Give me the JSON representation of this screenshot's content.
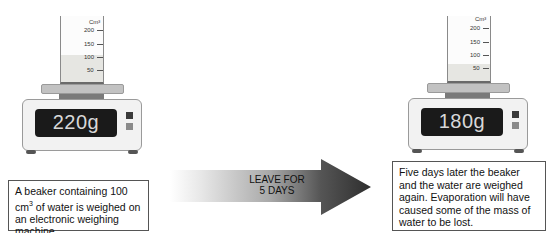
{
  "left_panel": {
    "beaker": {
      "unit_label": "Cm³",
      "ticks": [
        "200",
        "150",
        "100",
        "50"
      ],
      "water_level": "100"
    },
    "scale": {
      "reading": "220g"
    },
    "caption": {
      "line1_prefix": "A beaker containing 100 cm",
      "line1_sup": "3",
      "rest": "of water is weighed on an electronic weighing machine."
    }
  },
  "arrow": {
    "line1": "LEAVE FOR",
    "line2": "5 DAYS"
  },
  "right_panel": {
    "beaker": {
      "unit_label": "Cm³",
      "ticks": [
        "200",
        "150",
        "100",
        "50"
      ],
      "water_level": "50"
    },
    "scale": {
      "reading": "180g"
    },
    "caption": {
      "text": "Five days later the beaker and the water are weighed again. Evaporation will have caused some of the mass of water to be lost."
    }
  },
  "colors": {
    "display_bg": "#1a1a1a",
    "display_text": "#d8d8d8",
    "arrow_dark": "#333333",
    "water": "#e6e6e2"
  }
}
